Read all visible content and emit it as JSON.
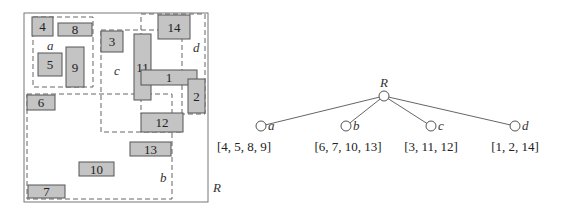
{
  "spatial_diagram": {
    "outer_label": "R",
    "regions": [
      {
        "name": "a",
        "x": 33,
        "y": 17,
        "w": 60,
        "h": 70,
        "label_x": 47,
        "label_y": 50
      },
      {
        "name": "b",
        "x": 27,
        "y": 94,
        "w": 145,
        "h": 105,
        "label_x": 160,
        "label_y": 182
      },
      {
        "name": "c",
        "x": 101,
        "y": 30,
        "w": 81,
        "h": 102,
        "label_x": 114,
        "label_y": 75
      },
      {
        "name": "d",
        "x": 141,
        "y": 14,
        "w": 64,
        "h": 100,
        "label_x": 193,
        "label_y": 52
      }
    ],
    "rects": [
      {
        "id": "4",
        "x": 32,
        "y": 17,
        "w": 21,
        "h": 19
      },
      {
        "id": "8",
        "x": 58,
        "y": 23,
        "w": 34,
        "h": 13
      },
      {
        "id": "3",
        "x": 101,
        "y": 31,
        "w": 22,
        "h": 21
      },
      {
        "id": "5",
        "x": 38,
        "y": 53,
        "w": 24,
        "h": 23
      },
      {
        "id": "9",
        "x": 66,
        "y": 47,
        "w": 18,
        "h": 40
      },
      {
        "id": "11",
        "x": 134,
        "y": 34,
        "w": 17,
        "h": 66
      },
      {
        "id": "14",
        "x": 158,
        "y": 15,
        "w": 32,
        "h": 24
      },
      {
        "id": "1",
        "x": 141,
        "y": 70,
        "w": 56,
        "h": 15
      },
      {
        "id": "2",
        "x": 188,
        "y": 79,
        "w": 17,
        "h": 34
      },
      {
        "id": "6",
        "x": 27,
        "y": 95,
        "w": 28,
        "h": 15
      },
      {
        "id": "12",
        "x": 141,
        "y": 113,
        "w": 42,
        "h": 19
      },
      {
        "id": "13",
        "x": 130,
        "y": 142,
        "w": 41,
        "h": 14
      },
      {
        "id": "10",
        "x": 79,
        "y": 162,
        "w": 35,
        "h": 14
      },
      {
        "id": "7",
        "x": 28,
        "y": 185,
        "w": 37,
        "h": 13
      }
    ]
  },
  "tree": {
    "root_label": "R",
    "root": {
      "x": 384,
      "y": 96
    },
    "children": [
      {
        "name": "a",
        "x": 261,
        "y": 126,
        "entries": "[4, 5, 8, 9]",
        "entries_x": 244
      },
      {
        "name": "b",
        "x": 346,
        "y": 126,
        "entries": "[6, 7, 10, 13]",
        "entries_x": 348
      },
      {
        "name": "c",
        "x": 431,
        "y": 126,
        "entries": "[3, 11, 12]",
        "entries_x": 431
      },
      {
        "name": "d",
        "x": 515,
        "y": 126,
        "entries": "[1, 2, 14]",
        "entries_x": 515
      }
    ]
  },
  "colors": {
    "rect_fill": "#c4c4c4",
    "rect_stroke": "#555555",
    "dash_stroke": "#666666",
    "outer_stroke": "#777777"
  }
}
